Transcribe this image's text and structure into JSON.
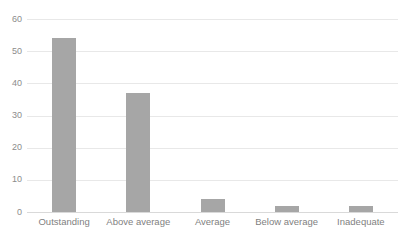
{
  "chart_data": {
    "type": "bar",
    "title": "",
    "xlabel": "",
    "ylabel": "",
    "categories": [
      "Outstanding",
      "Above average",
      "Average",
      "Below average",
      "Inadequate"
    ],
    "values": [
      54,
      37,
      4,
      2,
      2
    ],
    "ylim": [
      0,
      60
    ],
    "ytick_labels": [
      "0",
      "10",
      "20",
      "30",
      "40",
      "50",
      "60"
    ],
    "ytick_values": [
      0,
      10,
      20,
      30,
      40,
      50,
      60
    ],
    "grid": true,
    "legend": false,
    "bar_color": "#a6a6a6",
    "gridline_color": "#e8e8e8",
    "axis_color": "#d9d9d9",
    "tick_label_color": "#8c8c8c"
  }
}
